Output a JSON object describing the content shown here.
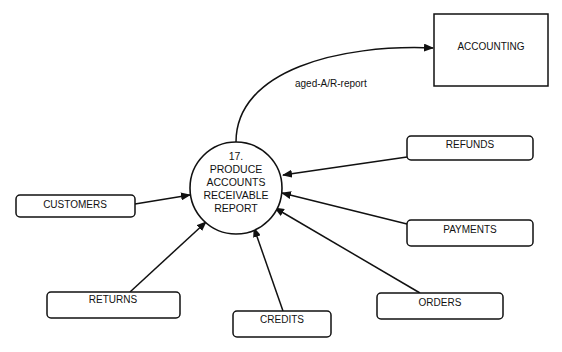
{
  "diagram": {
    "type": "data-flow-diagram",
    "colors": {
      "stroke": "#111111",
      "background": "#ffffff"
    },
    "process": {
      "number": "17.",
      "label_lines": [
        "PRODUCE",
        "ACCOUNTS",
        "RECEIVABLE",
        "REPORT"
      ]
    },
    "external_entities": [
      {
        "id": "accounting",
        "label": "ACCOUNTING"
      }
    ],
    "data_stores": [
      {
        "id": "customers",
        "label": "CUSTOMERS"
      },
      {
        "id": "refunds",
        "label": "REFUNDS"
      },
      {
        "id": "payments",
        "label": "PAYMENTS"
      },
      {
        "id": "returns",
        "label": "RETURNS"
      },
      {
        "id": "credits",
        "label": "CREDITS"
      },
      {
        "id": "orders",
        "label": "ORDERS"
      }
    ],
    "flows": [
      {
        "from": "process",
        "to": "accounting",
        "label": "aged-A/R-report"
      },
      {
        "from": "customers",
        "to": "process",
        "label": ""
      },
      {
        "from": "refunds",
        "to": "process",
        "label": ""
      },
      {
        "from": "payments",
        "to": "process",
        "label": ""
      },
      {
        "from": "returns",
        "to": "process",
        "label": ""
      },
      {
        "from": "credits",
        "to": "process",
        "label": ""
      },
      {
        "from": "orders",
        "to": "process",
        "label": ""
      }
    ]
  }
}
